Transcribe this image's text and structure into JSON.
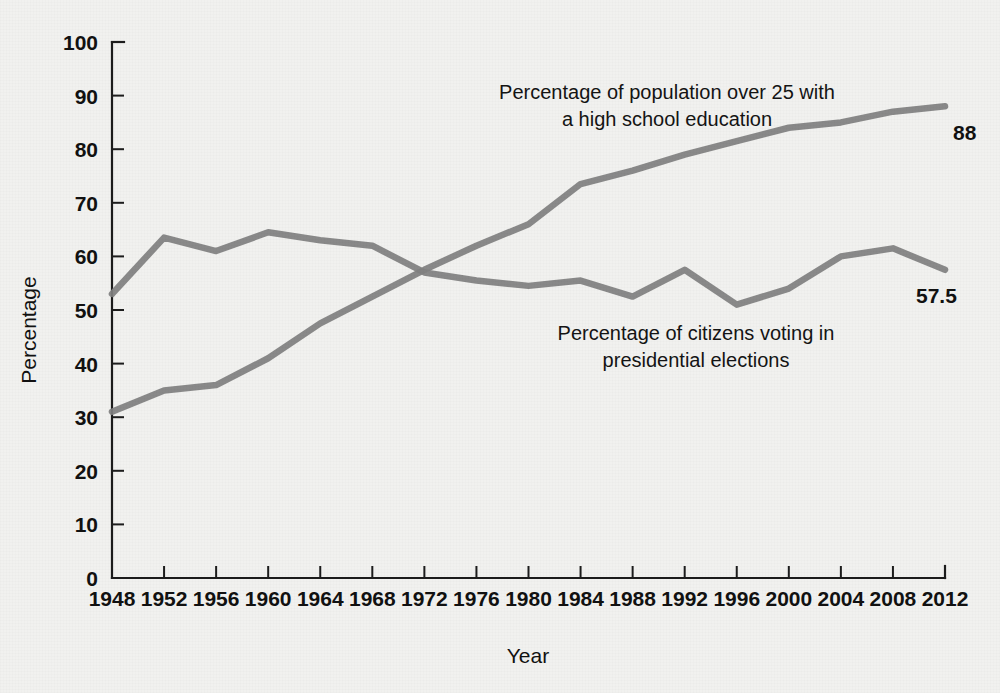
{
  "chart_data": {
    "type": "line",
    "title": "",
    "xlabel": "Year",
    "ylabel": "Percentage",
    "xlim": [
      1948,
      2012
    ],
    "ylim": [
      0,
      100
    ],
    "grid": false,
    "legend_position": "inline-annotation",
    "categories": [
      1948,
      1952,
      1956,
      1960,
      1964,
      1968,
      1972,
      1976,
      1980,
      1984,
      1988,
      1992,
      1996,
      2000,
      2004,
      2008,
      2012
    ],
    "x_tick_labels": [
      "1948",
      "1952",
      "1956",
      "1960",
      "1964",
      "1968",
      "1972",
      "1976",
      "1980",
      "1984",
      "1988",
      "1992",
      "1996",
      "2000",
      "2004",
      "2008",
      "2012"
    ],
    "y_tick_labels": [
      "0",
      "10",
      "20",
      "30",
      "40",
      "50",
      "60",
      "70",
      "80",
      "90",
      "100"
    ],
    "y_ticks": [
      0,
      10,
      20,
      30,
      40,
      50,
      60,
      70,
      80,
      90,
      100
    ],
    "series": [
      {
        "name": "Percentage of population over 25 with a high school education",
        "color": "#808080",
        "values": [
          31,
          35,
          36,
          41,
          47.5,
          52.5,
          57.5,
          62,
          66,
          73.5,
          76,
          79,
          81.5,
          84,
          85,
          87,
          88
        ],
        "end_label": "88"
      },
      {
        "name": "Percentage of citizens voting in presidential elections",
        "color": "#808080",
        "values": [
          53,
          63.5,
          61,
          64.5,
          63,
          62,
          57,
          55.5,
          54.5,
          55.5,
          52.5,
          57.5,
          51,
          54,
          60,
          61.5,
          57.5
        ],
        "end_label": "57.5"
      }
    ],
    "annotations": [
      {
        "id": "education-annotation",
        "line1": "Percentage of population over 25 with",
        "line2": "a high school education"
      },
      {
        "id": "voting-annotation",
        "line1": "Percentage of citizens voting in",
        "line2": "presidential elections"
      }
    ],
    "colors": {
      "line": "#808080",
      "axis": "#1c1c1c",
      "text": "#111111",
      "background": "#f1f1ef"
    }
  }
}
